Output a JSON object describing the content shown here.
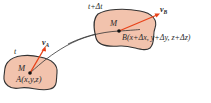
{
  "diagram": {
    "colors": {
      "blob_fill": "#f2c3ad",
      "blob_stroke": "#333333",
      "trajectory": "#333333",
      "velocity_arrow": "#e8431a",
      "point": "#111111"
    },
    "left_region": {
      "time_label": "t",
      "particle_label": "M",
      "point_label": "A(x,y,z)",
      "velocity_label": "v",
      "velocity_subscript": "A"
    },
    "right_region": {
      "time_label": "t+Δt",
      "particle_label": "M",
      "point_label": "B(x+Δx, y+Δy, z+Δz)",
      "velocity_label": "v",
      "velocity_subscript": "B"
    }
  }
}
